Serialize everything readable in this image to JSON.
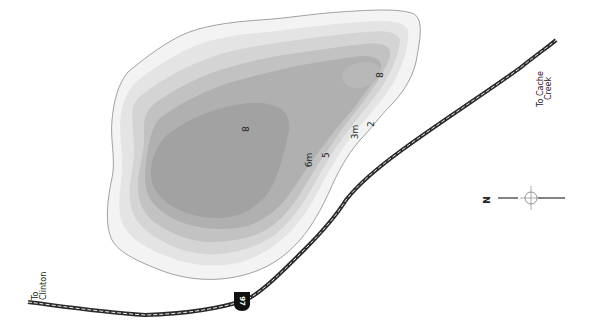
{
  "map": {
    "type": "bathymetric-lake-map",
    "colors": {
      "background": "#ffffff",
      "shoreline": "#8a8a8a",
      "depth_1": "#f3f3f3",
      "depth_2": "#e4e4e4",
      "depth_3": "#d4d4d4",
      "depth_4": "#c2c2c2",
      "depth_5": "#b0b0b0",
      "depth_6": "#a2a2a2",
      "road": "#2a2a2a",
      "road_dash": "#e8e8e8"
    },
    "depth_labels": [
      {
        "text": "8",
        "x": 242,
        "y": 129
      },
      {
        "text": "8",
        "x": 376,
        "y": 75
      },
      {
        "text": "6m",
        "x": 312,
        "y": 160
      },
      {
        "text": "5",
        "x": 329,
        "y": 155
      },
      {
        "text": "3m",
        "x": 358,
        "y": 132
      },
      {
        "text": "2",
        "x": 374,
        "y": 124
      }
    ],
    "destinations": [
      {
        "line1": "To",
        "line2": "Clinton"
      },
      {
        "line1": "To Cache",
        "line2": "Creek"
      }
    ],
    "highway": {
      "number": "97",
      "icon": "highway-shield-icon"
    },
    "compass": {
      "label": "N",
      "icon": "north-arrow-icon"
    }
  }
}
